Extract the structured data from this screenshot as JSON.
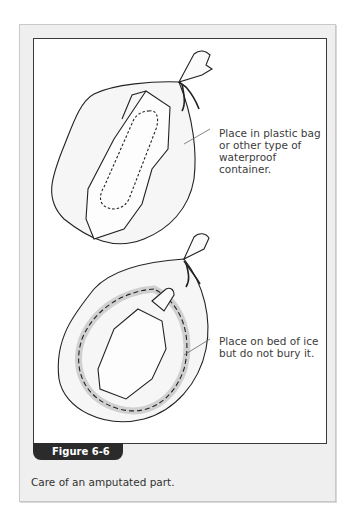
{
  "figure": {
    "label": "Figure 6-6",
    "caption": "Care of an amputated part.",
    "callouts": [
      {
        "text": "Place in plastic bag\nor other type of\nwaterproof container."
      },
      {
        "text": "Place on bed of ice\nbut do not bury it."
      }
    ],
    "illustrations": [
      {
        "name": "bagged-part",
        "description": "Amputated part in a sealed plastic bag tied at top"
      },
      {
        "name": "bag-on-ice",
        "description": "Bagged part placed inside a larger bag on a bed of ice cubes"
      }
    ],
    "colors": {
      "frame_bg": "#efefef",
      "panel_bg": "#ffffff",
      "panel_border": "#3a3a3a",
      "tab_bg": "#2b2b2b",
      "tab_text": "#ffffff",
      "text": "#333333"
    }
  }
}
